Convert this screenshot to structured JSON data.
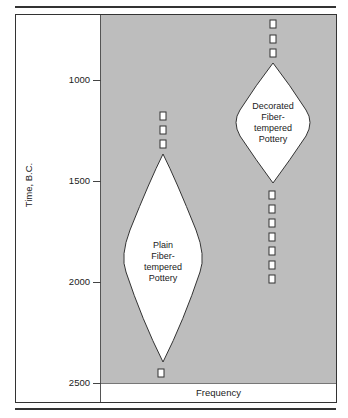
{
  "diagram": {
    "type": "battleship-seriation",
    "y_axis": {
      "label": "Time, B.C.",
      "ticks": [
        {
          "value": "1000",
          "y": 80
        },
        {
          "value": "1500",
          "y": 181
        },
        {
          "value": "2000",
          "y": 282
        },
        {
          "value": "2500",
          "y": 383
        }
      ]
    },
    "x_axis": {
      "label": "Frequency"
    },
    "series": [
      {
        "name": "Plain Fiber-tempered Pottery",
        "label_lines": [
          "Plain",
          "Fiber-",
          "tempered",
          "Pottery"
        ],
        "peak_start": "approx. 1350 B.C.",
        "peak_end": "approx. 2400 B.C.",
        "trace_markers_above": 3,
        "trace_markers_below": 1
      },
      {
        "name": "Decorated Fiber-tempered Pottery",
        "label_lines": [
          "Decorated",
          "Fiber-",
          "tempered",
          "Pottery"
        ],
        "peak_start": "approx. 900 B.C.",
        "peak_end": "approx. 1500 B.C.",
        "trace_markers_above": 3,
        "trace_markers_below": 7
      }
    ]
  },
  "colors": {
    "plot_background": "#bdbdbd",
    "shape_fill": "#ffffff",
    "stroke": "#333333"
  }
}
